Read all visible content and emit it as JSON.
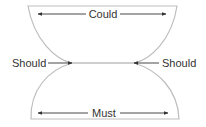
{
  "diagram": {
    "top_region": {
      "label": "Could"
    },
    "bottom_region": {
      "label": "Must"
    },
    "left_pointer": {
      "label": "Should"
    },
    "right_pointer": {
      "label": "Should"
    },
    "colors": {
      "outline": "#bdbdbd",
      "arrow": "#333333",
      "text": "#333333",
      "background": "#ffffff"
    }
  }
}
